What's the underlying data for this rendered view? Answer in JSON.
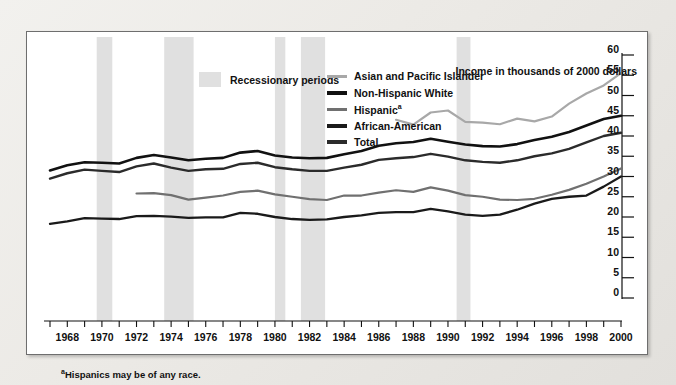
{
  "unit_title": "Income in thousands of 2000 dollars",
  "footnote_marker": "a",
  "footnote_text": "Hispanics may be of any race.",
  "recession_legend_label": "Recessionary periods",
  "recession_color": "#e0e0e0",
  "chart_data": {
    "type": "line",
    "title": "",
    "subtitle": "",
    "xlabel": "",
    "ylabel": "Income in thousands of 2000 dollars",
    "xlim": [
      1967,
      2000
    ],
    "ylim": [
      0,
      60
    ],
    "ytick_step": 5,
    "yticks": [
      0,
      5,
      10,
      15,
      20,
      25,
      30,
      35,
      40,
      45,
      50,
      55,
      60
    ],
    "xticks": [
      1967,
      1968,
      1969,
      1970,
      1971,
      1972,
      1973,
      1974,
      1975,
      1976,
      1977,
      1978,
      1979,
      1980,
      1981,
      1982,
      1983,
      1984,
      1985,
      1986,
      1987,
      1988,
      1989,
      1990,
      1991,
      1992,
      1993,
      1994,
      1995,
      1996,
      1997,
      1998,
      1999,
      2000
    ],
    "xtick_labels": [
      "",
      "1968",
      "",
      "1970",
      "",
      "1972",
      "",
      "1974",
      "",
      "1976",
      "",
      "1978",
      "",
      "1980",
      "",
      "1982",
      "",
      "1984",
      "",
      "1986",
      "",
      "1988",
      "",
      "1990",
      "",
      "1992",
      "",
      "1994",
      "",
      "1996",
      "",
      "1998",
      "",
      "2000"
    ],
    "grid": false,
    "legend_position": "top-right",
    "shaded_bands_label": "Recessionary periods",
    "shaded_bands": [
      {
        "start": 1969.7,
        "end": 1970.6
      },
      {
        "start": 1973.6,
        "end": 1975.3
      },
      {
        "start": 1980.0,
        "end": 1980.6
      },
      {
        "start": 1981.5,
        "end": 1982.9
      },
      {
        "start": 1990.5,
        "end": 1991.3
      }
    ],
    "series": [
      {
        "name": "Asian and Pacific Islander",
        "color": "#a8a8a8",
        "width": 2.2,
        "x": [
          1987,
          1988,
          1989,
          1990,
          1991,
          1992,
          1993,
          1994,
          1995,
          1996,
          1997,
          1998,
          1999,
          2000
        ],
        "values": [
          44.0,
          42.8,
          45.8,
          46.3,
          43.5,
          43.3,
          42.9,
          44.3,
          43.6,
          44.8,
          48.0,
          50.5,
          52.5,
          55.5
        ]
      },
      {
        "name": "Non-Hispanic White",
        "color": "#111111",
        "width": 2.6,
        "x": [
          1967,
          1968,
          1969,
          1970,
          1971,
          1972,
          1973,
          1974,
          1975,
          1976,
          1977,
          1978,
          1979,
          1980,
          1981,
          1982,
          1983,
          1984,
          1985,
          1986,
          1987,
          1988,
          1989,
          1990,
          1991,
          1992,
          1993,
          1994,
          1995,
          1996,
          1997,
          1998,
          1999,
          2000
        ],
        "values": [
          31.5,
          32.8,
          33.5,
          33.4,
          33.2,
          34.6,
          35.3,
          34.7,
          34.0,
          34.4,
          34.6,
          35.9,
          36.3,
          35.2,
          34.7,
          34.5,
          34.6,
          35.5,
          36.3,
          37.6,
          38.2,
          38.5,
          39.3,
          38.6,
          37.9,
          37.5,
          37.4,
          38.0,
          39.0,
          39.8,
          41.0,
          42.6,
          44.2,
          45.0
        ]
      },
      {
        "name": "Hispanic",
        "color": "#707070",
        "width": 2.2,
        "x": [
          1972,
          1973,
          1974,
          1975,
          1976,
          1977,
          1978,
          1979,
          1980,
          1981,
          1982,
          1983,
          1984,
          1985,
          1986,
          1987,
          1988,
          1989,
          1990,
          1991,
          1992,
          1993,
          1994,
          1995,
          1996,
          1997,
          1998,
          1999,
          2000
        ],
        "values": [
          25.8,
          25.9,
          25.4,
          24.3,
          24.8,
          25.3,
          26.2,
          26.5,
          25.6,
          25.0,
          24.4,
          24.2,
          25.3,
          25.3,
          26.0,
          26.6,
          26.2,
          27.3,
          26.5,
          25.4,
          25.0,
          24.3,
          24.2,
          24.5,
          25.5,
          26.7,
          28.2,
          30.0,
          32.0
        ]
      },
      {
        "name": "African-American",
        "color": "#1a1a1a",
        "width": 2.3,
        "x": [
          1967,
          1968,
          1969,
          1970,
          1971,
          1972,
          1973,
          1974,
          1975,
          1976,
          1977,
          1978,
          1979,
          1980,
          1981,
          1982,
          1983,
          1984,
          1985,
          1986,
          1987,
          1988,
          1989,
          1990,
          1991,
          1992,
          1993,
          1994,
          1995,
          1996,
          1997,
          1998,
          1999,
          2000
        ],
        "values": [
          18.3,
          18.9,
          19.7,
          19.6,
          19.5,
          20.2,
          20.3,
          20.1,
          19.8,
          19.9,
          19.9,
          21.0,
          20.8,
          20.0,
          19.5,
          19.3,
          19.4,
          20.0,
          20.4,
          21.0,
          21.2,
          21.2,
          22.0,
          21.4,
          20.6,
          20.3,
          20.6,
          21.8,
          23.3,
          24.5,
          25.0,
          25.3,
          27.5,
          30.0
        ]
      },
      {
        "name": "Total",
        "color": "#2b2b2b",
        "width": 2.4,
        "x": [
          1967,
          1968,
          1969,
          1970,
          1971,
          1972,
          1973,
          1974,
          1975,
          1976,
          1977,
          1978,
          1979,
          1980,
          1981,
          1982,
          1983,
          1984,
          1985,
          1986,
          1987,
          1988,
          1989,
          1990,
          1991,
          1992,
          1993,
          1994,
          1995,
          1996,
          1997,
          1998,
          1999,
          2000
        ],
        "values": [
          29.5,
          30.8,
          31.7,
          31.4,
          31.1,
          32.5,
          33.2,
          32.2,
          31.4,
          31.8,
          31.9,
          33.1,
          33.4,
          32.3,
          31.8,
          31.4,
          31.4,
          32.2,
          32.9,
          34.1,
          34.5,
          34.8,
          35.6,
          34.9,
          34.0,
          33.6,
          33.4,
          34.0,
          35.0,
          35.7,
          36.8,
          38.4,
          40.0,
          40.8
        ]
      }
    ]
  },
  "legend": {
    "items": [
      {
        "label": "Asian and Pacific Islander",
        "color": "#a8a8a8",
        "thick": false,
        "note": ""
      },
      {
        "label": "Non-Hispanic White",
        "color": "#111111",
        "thick": true,
        "note": ""
      },
      {
        "label": "Hispanic",
        "color": "#707070",
        "thick": false,
        "note": "a"
      },
      {
        "label": "African-American",
        "color": "#1a1a1a",
        "thick": true,
        "note": ""
      },
      {
        "label": "Total",
        "color": "#2b2b2b",
        "thick": true,
        "note": ""
      }
    ]
  }
}
